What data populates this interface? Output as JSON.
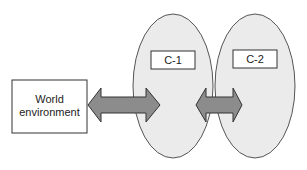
{
  "diagram": {
    "nodes": [
      {
        "id": "world",
        "label_line1": "World",
        "label_line2": "environment",
        "shape": "rectangle"
      },
      {
        "id": "c1",
        "label": "C-1",
        "shape": "ellipse"
      },
      {
        "id": "c2",
        "label": "C-2",
        "shape": "ellipse"
      }
    ],
    "edges": [
      {
        "from": "world",
        "to": "c1",
        "type": "bidirectional-arrow"
      },
      {
        "from": "c1",
        "to": "c2",
        "type": "bidirectional-arrow"
      }
    ],
    "colors": {
      "ellipse_fill": "#ebebeb",
      "ellipse_stroke": "#555555",
      "arrow_fill": "#8c8c8c",
      "arrow_stroke": "#333333",
      "box_fill": "#ffffff",
      "box_stroke": "#333333"
    }
  }
}
